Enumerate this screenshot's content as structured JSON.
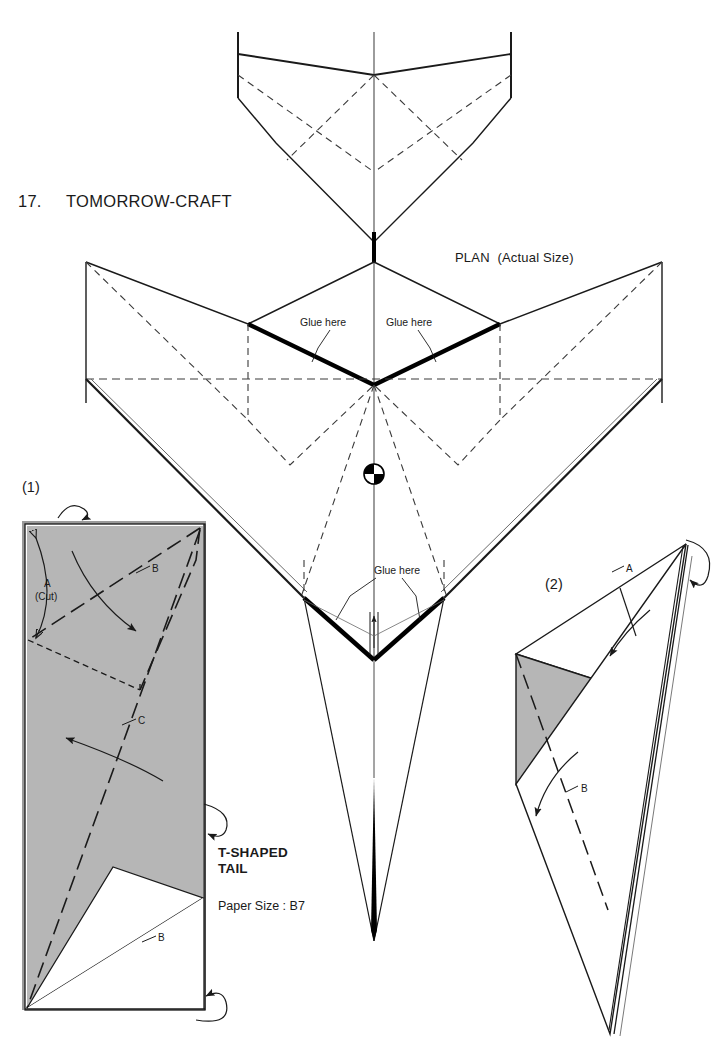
{
  "document": {
    "model_number": "17.",
    "model_name": "TOMORROW-CRAFT",
    "plan_label": "PLAN  (Actual Size)",
    "tail_type_line1": "T-SHAPED",
    "tail_type_line2": "TAIL",
    "paper_size": "Paper Size : B7"
  },
  "plan": {
    "glue_labels": [
      "Glue here",
      "Glue here",
      "Glue here"
    ],
    "cg_marker": "cg-marker",
    "colors": {
      "line": "#1a1a1a",
      "thick_line": "#000000",
      "dashed_line": "#3a3a3a",
      "paper_gray": "#b6b6b6",
      "background": "#ffffff"
    }
  },
  "steps": [
    {
      "number": "(1)",
      "marks": [
        {
          "id": "a",
          "label": "A"
        },
        {
          "id": "a_cut",
          "label": "(Cut)"
        },
        {
          "id": "b_top",
          "label": "B"
        },
        {
          "id": "c",
          "label": "C"
        },
        {
          "id": "b_bottom",
          "label": "B"
        }
      ]
    },
    {
      "number": "(2)",
      "marks": [
        {
          "id": "a",
          "label": "A"
        },
        {
          "id": "b",
          "label": "B"
        }
      ]
    }
  ]
}
